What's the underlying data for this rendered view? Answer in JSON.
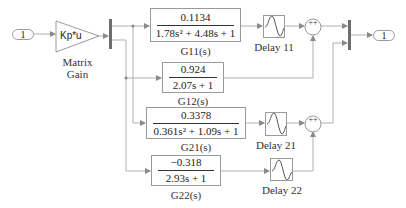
{
  "diagram": {
    "type": "simulink-block-diagram",
    "inport": {
      "label": "1"
    },
    "outport": {
      "label": "1"
    },
    "gain": {
      "text": "Kp*u",
      "label_line1": "Matrix",
      "label_line2": "Gain"
    },
    "transfer_functions": [
      {
        "id": "G11",
        "numerator": "0.1134",
        "denominator": "1.78s² + 4.48s + 1",
        "label": "G11(s)"
      },
      {
        "id": "G12",
        "numerator": "0.924",
        "denominator": "2.07s + 1",
        "label": "G12(s)"
      },
      {
        "id": "G21",
        "numerator": "0.3378",
        "denominator": "0.361s² + 1.09s + 1",
        "label": "G21(s)"
      },
      {
        "id": "G22",
        "numerator": "−0.318",
        "denominator": "2.93s + 1",
        "label": "G22(s)"
      }
    ],
    "delays": [
      {
        "id": "D11",
        "label": "Delay 11"
      },
      {
        "id": "D21",
        "label": "Delay 21"
      },
      {
        "id": "D22",
        "label": "Delay 22"
      }
    ],
    "sums": [
      {
        "id": "S1",
        "signs": "++"
      },
      {
        "id": "S2",
        "signs": "++"
      }
    ],
    "colors": {
      "wire": "#a8a8a8",
      "block_border": "#9a9a9a",
      "bus": "#6e6e6e"
    }
  }
}
